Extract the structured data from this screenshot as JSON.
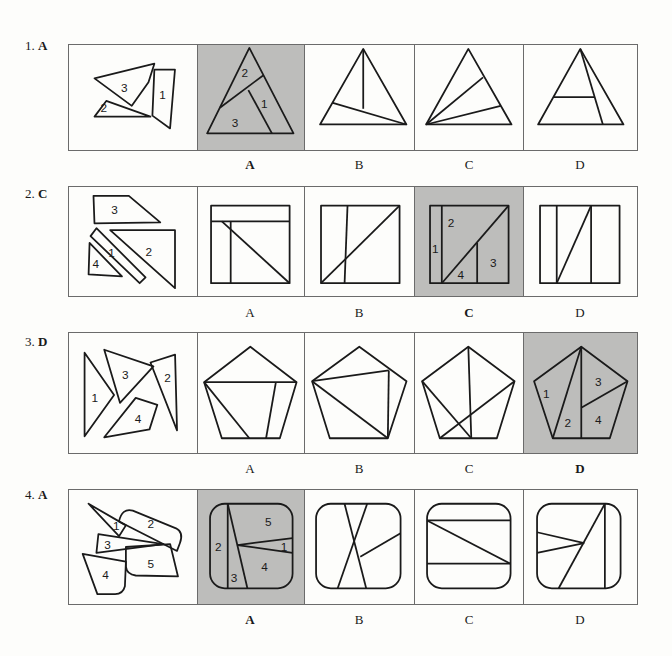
{
  "questions": [
    {
      "number": "1.",
      "answer": "A",
      "options": [
        "A",
        "B",
        "C",
        "D"
      ],
      "correct_option": "A",
      "piece_labels": [
        "1",
        "2",
        "3"
      ],
      "answer_labels": [
        "2",
        "1",
        "3"
      ]
    },
    {
      "number": "2.",
      "answer": "C",
      "options": [
        "A",
        "B",
        "C",
        "D"
      ],
      "correct_option": "C",
      "piece_labels": [
        "3",
        "1",
        "2",
        "4"
      ],
      "answer_labels": [
        "1",
        "2",
        "3",
        "4"
      ]
    },
    {
      "number": "3.",
      "answer": "D",
      "options": [
        "A",
        "B",
        "C",
        "D"
      ],
      "correct_option": "D",
      "piece_labels": [
        "1",
        "3",
        "2",
        "4"
      ],
      "answer_labels": [
        "1",
        "3",
        "2",
        "4"
      ]
    },
    {
      "number": "4.",
      "answer": "A",
      "options": [
        "A",
        "B",
        "C",
        "D"
      ],
      "correct_option": "A",
      "piece_labels": [
        "1",
        "2",
        "3",
        "4",
        "5"
      ],
      "answer_labels": [
        "5",
        "2",
        "1",
        "4",
        "3"
      ]
    }
  ],
  "colors": {
    "shaded": "#bdbdbb",
    "border": "#6b6b6b",
    "stroke": "#1a1a1a"
  }
}
